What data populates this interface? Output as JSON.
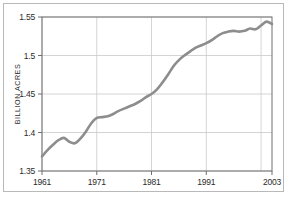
{
  "chart_data": {
    "type": "line",
    "title": "",
    "subtitle": "",
    "xlabel": "",
    "ylabel": "BILLION ACRES",
    "xlim": [
      1961,
      2003
    ],
    "ylim": [
      1.35,
      1.55
    ],
    "grid": true,
    "legend": null,
    "x_ticks": [
      "1961",
      "1971",
      "1981",
      "1991",
      "2003"
    ],
    "x_tick_values": [
      1961,
      1971,
      1981,
      1991,
      2003
    ],
    "y_ticks": [
      "1.35",
      "1.4",
      "1.45",
      "1.5",
      "1.55"
    ],
    "y_tick_values": [
      1.35,
      1.4,
      1.45,
      1.5,
      1.55
    ],
    "x_gridlines": [
      1961,
      1971,
      1981,
      1991,
      2001
    ],
    "y_gridlines": [
      1.35,
      1.4,
      1.45,
      1.5,
      1.55
    ],
    "line_color": "#8d8d8d",
    "grid_color": "#c9c9c9",
    "axis_color": "#6f6f6f",
    "x": [
      1961,
      1962,
      1963,
      1964,
      1965,
      1966,
      1967,
      1968,
      1969,
      1970,
      1971,
      1972,
      1973,
      1974,
      1975,
      1976,
      1977,
      1978,
      1979,
      1980,
      1981,
      1982,
      1983,
      1984,
      1985,
      1986,
      1987,
      1988,
      1989,
      1990,
      1991,
      1992,
      1993,
      1994,
      1995,
      1996,
      1997,
      1998,
      1999,
      2000,
      2001,
      2002,
      2003
    ],
    "series": [
      {
        "name": "World cropland",
        "values": [
          1.369,
          1.377,
          1.384,
          1.39,
          1.393,
          1.388,
          1.386,
          1.392,
          1.401,
          1.412,
          1.419,
          1.42,
          1.421,
          1.424,
          1.428,
          1.431,
          1.434,
          1.437,
          1.441,
          1.446,
          1.45,
          1.456,
          1.465,
          1.475,
          1.486,
          1.494,
          1.5,
          1.505,
          1.51,
          1.513,
          1.516,
          1.52,
          1.525,
          1.529,
          1.531,
          1.532,
          1.531,
          1.532,
          1.535,
          1.534,
          1.539,
          1.544,
          1.541
        ]
      }
    ]
  },
  "figure": {
    "frame_label": "chart-frame"
  }
}
